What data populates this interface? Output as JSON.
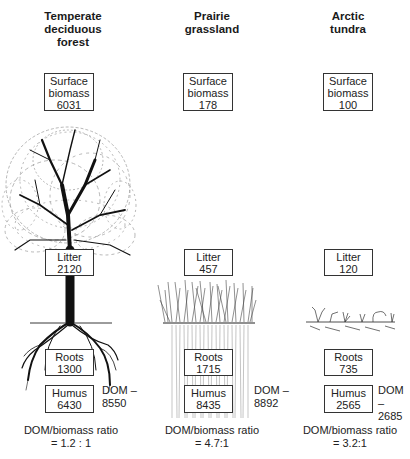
{
  "columns": [
    {
      "title": [
        "Temperate",
        "deciduous",
        "forest"
      ],
      "surface_biomass": {
        "label": [
          "Surface",
          "biomass"
        ],
        "value": "6031"
      },
      "litter": {
        "label": "Litter",
        "value": "2120"
      },
      "roots": {
        "label": "Roots",
        "value": "1300"
      },
      "humus": {
        "label": "Humus",
        "value": "6430"
      },
      "dom": {
        "label": "DOM –",
        "value": "8550"
      },
      "ratio": {
        "label": "DOM/biomass ratio",
        "value": "= 1.2 : 1"
      },
      "illustration": "deciduous-tree"
    },
    {
      "title": [
        "Prairie",
        "grassland"
      ],
      "surface_biomass": {
        "label": [
          "Surface",
          "biomass"
        ],
        "value": "178"
      },
      "litter": {
        "label": "Litter",
        "value": "457"
      },
      "roots": {
        "label": "Roots",
        "value": "1715"
      },
      "humus": {
        "label": "Humus",
        "value": "8435"
      },
      "dom": {
        "label": "DOM –",
        "value": "8892"
      },
      "ratio": {
        "label": "DOM/biomass ratio",
        "value": "= 4.7:1"
      },
      "illustration": "prairie-grass"
    },
    {
      "title": [
        "Arctic",
        "tundra"
      ],
      "surface_biomass": {
        "label": [
          "Surface",
          "biomass"
        ],
        "value": "100"
      },
      "litter": {
        "label": "Litter",
        "value": "120"
      },
      "roots": {
        "label": "Roots",
        "value": "735"
      },
      "humus": {
        "label": "Humus",
        "value": "2565"
      },
      "dom": {
        "label": "DOM –",
        "value": "2685"
      },
      "ratio": {
        "label": "DOM/biomass ratio",
        "value": "= 3.2:1"
      },
      "illustration": "tundra-plants"
    }
  ]
}
